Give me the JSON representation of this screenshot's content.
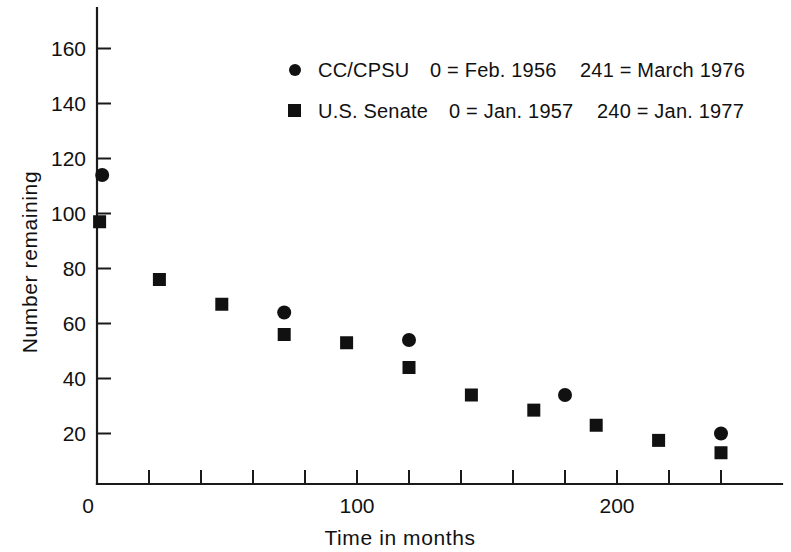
{
  "figure": {
    "background": "#ffffff",
    "ink": "#111111"
  },
  "chart_data": {
    "type": "scatter",
    "title": "",
    "xlabel": "Time in months",
    "ylabel": "Number remaining",
    "xlim": [
      0,
      262
    ],
    "ylim": [
      0,
      170
    ],
    "grid": false,
    "legend_position": "top-right",
    "xticks": [
      0,
      20,
      40,
      60,
      80,
      100,
      120,
      140,
      160,
      180,
      200,
      220,
      240,
      260
    ],
    "xtick_labels": [
      {
        "value": 0,
        "label": "0"
      },
      {
        "value": 100,
        "label": "100"
      },
      {
        "value": 200,
        "label": "200"
      }
    ],
    "yticks": [
      20,
      40,
      60,
      80,
      100,
      120,
      140,
      160
    ],
    "ytick_labels": [
      "20",
      "40",
      "60",
      "80",
      "100",
      "120",
      "140",
      "160"
    ],
    "series": [
      {
        "name": "CC/CPSU",
        "marker": "circle",
        "color": "#111111",
        "legend_note_start": "0 = Feb. 1956",
        "legend_note_end": "241 = March 1976",
        "points": [
          {
            "x": 2,
            "y": 114
          },
          {
            "x": 72,
            "y": 64
          },
          {
            "x": 120,
            "y": 54
          },
          {
            "x": 180,
            "y": 34
          },
          {
            "x": 240,
            "y": 20
          }
        ]
      },
      {
        "name": "U.S. Senate",
        "marker": "square",
        "color": "#111111",
        "legend_note_start": "0 = Jan. 1957",
        "legend_note_end": "240 = Jan. 1977",
        "points": [
          {
            "x": 1,
            "y": 97
          },
          {
            "x": 24,
            "y": 76
          },
          {
            "x": 48,
            "y": 67
          },
          {
            "x": 72,
            "y": 56
          },
          {
            "x": 96,
            "y": 53
          },
          {
            "x": 120,
            "y": 44
          },
          {
            "x": 144,
            "y": 34
          },
          {
            "x": 168,
            "y": 28.5
          },
          {
            "x": 192,
            "y": 23
          },
          {
            "x": 216,
            "y": 17.5
          },
          {
            "x": 240,
            "y": 13
          }
        ]
      }
    ]
  },
  "legend": {
    "rows": [
      {
        "marker": "circle",
        "label": "CC/CPSU",
        "note_start": "0 = Feb. 1956",
        "note_end": "241 = March 1976"
      },
      {
        "marker": "square",
        "label": "U.S. Senate",
        "note_start": "0 = Jan. 1957",
        "note_end": "240 = Jan. 1977"
      }
    ]
  },
  "axes": {
    "x_title": "Time in months",
    "y_title": "Number remaining",
    "y_tick_labels": [
      "160",
      "140",
      "120",
      "100",
      "80",
      "60",
      "40",
      "20"
    ],
    "x_tick_labels": [
      "0",
      "100",
      "200"
    ]
  }
}
